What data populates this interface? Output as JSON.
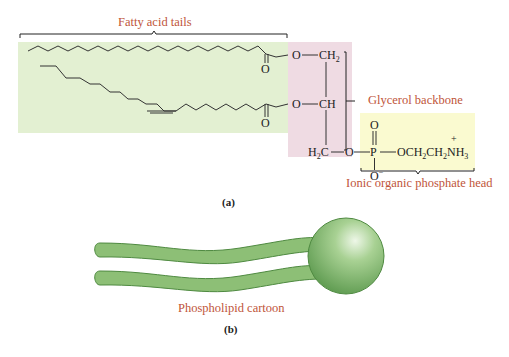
{
  "labels": {
    "fatty_acid_tails": "Fatty acid tails",
    "glycerol_backbone": "Glycerol backbone",
    "phosphate_head": "Ionic organic phosphate head",
    "cartoon": "Phospholipid cartoon",
    "panel_a": "(a)",
    "panel_b": "(b)"
  },
  "chem": {
    "ester_o_top": "O",
    "carbonyl_o_top": "O",
    "ester_o_bottom": "O",
    "carbonyl_o_bottom": "O",
    "ch2_top": "CH",
    "ch2_top_sub": "2",
    "ch_mid": "CH",
    "h2c_bottom_h": "H",
    "h2c_bottom_sub": "2",
    "h2c_bottom_c": "C",
    "bridge_o": "O",
    "phosphorus": "P",
    "phosphoryl_o": "O",
    "phosphate_o_minus": "O",
    "minus": "−",
    "ethanolamine_och2": "OCH",
    "sub2a": "2",
    "ch2": "CH",
    "sub2b": "2",
    "nh3": "NH",
    "sub3": "3",
    "plus": "+"
  },
  "colors": {
    "tails_region": "#e3f0d2",
    "glycerol_region": "#efdbe3",
    "head_region": "#fafad0",
    "label_text": "#c0553a",
    "cartoon_green": "#6fae5f"
  }
}
